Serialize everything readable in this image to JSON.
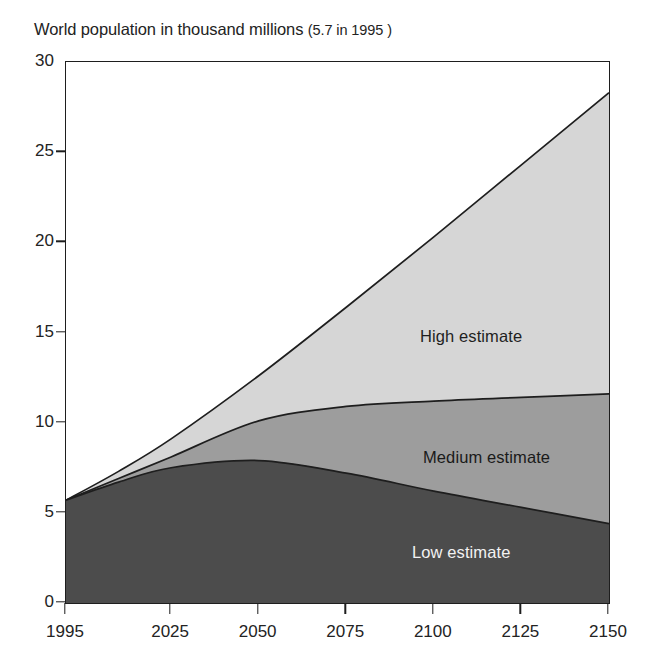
{
  "title": {
    "main": "World population in thousand millions",
    "note": "(5.7 in 1995 )"
  },
  "colors": {
    "high_fill": "#d6d6d6",
    "medium_fill": "#9d9d9d",
    "low_fill": "#4c4c4c",
    "line": "#1e1e1e",
    "axis": "#1e1e1e",
    "text": "#232323",
    "label_light": "#f2f2f2"
  },
  "labels": {
    "high": "High estimate",
    "medium": "Medium estimate",
    "low": "Low estimate"
  },
  "chart_data": {
    "type": "area",
    "title": "World population in thousand millions (5.7 in 1995 )",
    "subtitle": "",
    "xlabel": "",
    "ylabel": "",
    "xlim": [
      1995,
      2150
    ],
    "ylim": [
      0,
      30
    ],
    "xticks": [
      1995,
      2025,
      2050,
      2075,
      2100,
      2125,
      2150
    ],
    "xtick_labels": [
      "1995",
      "2025",
      "2050",
      "2075",
      "2100",
      "2125",
      "2150"
    ],
    "yticks": [
      0,
      5,
      10,
      15,
      20,
      25,
      30
    ],
    "ytick_labels": [
      "0",
      "5",
      "10",
      "15",
      "20",
      "25",
      "30"
    ],
    "grid": false,
    "legend": "in-plot annotations",
    "stacking": "overlaid bands (not cumulative)",
    "x": [
      1995,
      2010,
      2025,
      2050,
      2075,
      2100,
      2125,
      2150
    ],
    "series": [
      {
        "name": "High estimate",
        "values": [
          5.7,
          7.3,
          9.1,
          12.6,
          16.4,
          20.3,
          24.3,
          28.3
        ]
      },
      {
        "name": "Medium estimate",
        "values": [
          5.7,
          6.9,
          8.1,
          10.1,
          10.9,
          11.2,
          11.4,
          11.6
        ]
      },
      {
        "name": "Low estimate",
        "values": [
          5.7,
          6.7,
          7.5,
          7.9,
          7.2,
          6.2,
          5.3,
          4.4
        ]
      }
    ],
    "annotations": [
      {
        "text": "High estimate",
        "x": 2100,
        "y": 16.2
      },
      {
        "text": "Medium estimate",
        "x": 2103,
        "y": 9.5
      },
      {
        "text": "Low estimate",
        "x": 2098,
        "y": 4.1
      }
    ]
  }
}
